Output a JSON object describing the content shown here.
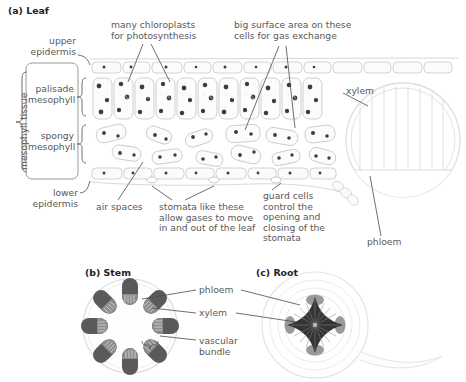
{
  "figure": {
    "panels": [
      {
        "id": "a",
        "title": "(a) Leaf"
      },
      {
        "id": "b",
        "title": "(b) Stem"
      },
      {
        "id": "c",
        "title": "(c) Root"
      }
    ]
  },
  "leaf": {
    "labels": {
      "upper_epidermis": "upper\nepidermis",
      "lower_epidermis": "lower\nepidermis",
      "mesophyll_tissue": "mesophyll tissue",
      "palisade": "palisade\nmesophyll",
      "spongy": "spongy\nmesophyll",
      "chloroplasts": "many chloroplasts\nfor photosynthesis",
      "surface_area": "big surface area on these\ncells for gas exchange",
      "xylem": "xylem",
      "phloem": "phloem",
      "air_spaces": "air spaces",
      "stomata": "stomata like these\nallow gases to move\nin and out of the leaf",
      "guard_cells": "guard cells\ncontrol the\nopening and\nclosing of the\nstomata"
    }
  },
  "stem": {
    "labels": {
      "phloem": "phloem",
      "xylem": "xylem",
      "vascular_bundle": "vascular\nbundle"
    }
  },
  "root": {
    "labels": {
      "phloem": "phloem",
      "xylem": "xylem"
    }
  },
  "colors": {
    "text": "#58585a",
    "title": "#232323",
    "leader": "#4a4a4a",
    "cell_outline": "#c9c9c9",
    "cell_fill": "#fbfbfb",
    "chloroplast": "#3b3b3b",
    "phloem_dark": "#474747",
    "xylem_mid": "#8e8e8e",
    "vein_outline": "#dcdcdc",
    "root_outline": "#e2e2e2"
  }
}
